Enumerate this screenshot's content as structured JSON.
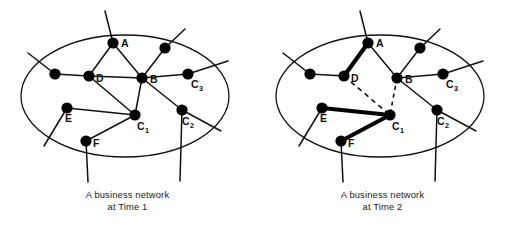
{
  "figure": {
    "colors": {
      "ink": "#111111",
      "node_fill": "#000000",
      "background": "#ffffff",
      "bold_edge": "#000000"
    }
  },
  "panels": [
    {
      "id": "time1",
      "caption_line1": "A business network",
      "caption_line2": "at Time 1",
      "boundary": {
        "shape": "ellipse",
        "cx": 125,
        "cy": 96,
        "rx": 104,
        "ry": 61
      },
      "nodes": [
        {
          "id": "A",
          "label": "A",
          "sub": "",
          "x": 113,
          "y": 43,
          "r": 5.6,
          "label_dx": 8,
          "label_dy": 4
        },
        {
          "id": "B",
          "label": "B",
          "sub": "",
          "x": 142,
          "y": 78,
          "r": 5.6,
          "label_dx": 8,
          "label_dy": 5
        },
        {
          "id": "D",
          "label": "D",
          "sub": "",
          "x": 89,
          "y": 76,
          "r": 5.6,
          "label_dx": 7,
          "label_dy": 6
        },
        {
          "id": "E",
          "label": "E",
          "sub": "",
          "x": 67,
          "y": 108,
          "r": 5.6,
          "label_dx": -2,
          "label_dy": 14
        },
        {
          "id": "F",
          "label": "F",
          "sub": "",
          "x": 86,
          "y": 141,
          "r": 5.6,
          "label_dx": 7,
          "label_dy": 6
        },
        {
          "id": "C1",
          "label": "C",
          "sub": "1",
          "x": 135,
          "y": 115,
          "r": 5.6,
          "label_dx": 2,
          "label_dy": 15
        },
        {
          "id": "C2",
          "label": "C",
          "sub": "2",
          "x": 182,
          "y": 110,
          "r": 5.6,
          "label_dx": 0,
          "label_dy": 15
        },
        {
          "id": "C3",
          "label": "C",
          "sub": "3",
          "x": 188,
          "y": 74,
          "r": 5.6,
          "label_dx": 3,
          "label_dy": 14
        },
        {
          "id": "U1",
          "label": "",
          "sub": "",
          "x": 55,
          "y": 74,
          "r": 5.6,
          "label_dx": 0,
          "label_dy": 0
        },
        {
          "id": "U2",
          "label": "",
          "sub": "",
          "x": 165,
          "y": 48,
          "r": 5.6,
          "label_dx": 0,
          "label_dy": 0
        }
      ],
      "edges": [
        {
          "from": "A",
          "to": "D",
          "style": "plain"
        },
        {
          "from": "A",
          "to": "B",
          "style": "plain"
        },
        {
          "from": "D",
          "to": "B",
          "style": "plain"
        },
        {
          "from": "D",
          "to": "U1",
          "style": "plain"
        },
        {
          "from": "D",
          "to": "C1",
          "style": "plain"
        },
        {
          "from": "B",
          "to": "C1",
          "style": "plain"
        },
        {
          "from": "B",
          "to": "C2",
          "style": "plain"
        },
        {
          "from": "B",
          "to": "C3",
          "style": "plain"
        },
        {
          "from": "B",
          "to": "U2",
          "style": "plain"
        },
        {
          "from": "E",
          "to": "C1",
          "style": "plain"
        },
        {
          "from": "F",
          "to": "C1",
          "style": "plain"
        }
      ],
      "stubs": [
        {
          "from": "A",
          "x2": 105,
          "y2": 11
        },
        {
          "from": "U1",
          "x2": 28,
          "y2": 53
        },
        {
          "from": "U2",
          "x2": 185,
          "y2": 29
        },
        {
          "from": "C3",
          "x2": 228,
          "y2": 61
        },
        {
          "from": "C2",
          "x2": 221,
          "y2": 131
        },
        {
          "from": "E",
          "x2": 44,
          "y2": 146
        },
        {
          "from": "F",
          "x2": 88,
          "y2": 182
        },
        {
          "from": "C2",
          "x2": 180,
          "y2": 181
        }
      ]
    },
    {
      "id": "time2",
      "caption_line1": "A business network",
      "caption_line2": "at Time 2",
      "boundary": {
        "shape": "ellipse",
        "cx": 125,
        "cy": 96,
        "rx": 104,
        "ry": 61
      },
      "nodes": [
        {
          "id": "A",
          "label": "A",
          "sub": "",
          "x": 113,
          "y": 43,
          "r": 5.6,
          "label_dx": 8,
          "label_dy": 4
        },
        {
          "id": "B",
          "label": "B",
          "sub": "",
          "x": 142,
          "y": 78,
          "r": 5.6,
          "label_dx": 8,
          "label_dy": 5
        },
        {
          "id": "D",
          "label": "D",
          "sub": "",
          "x": 89,
          "y": 76,
          "r": 5.6,
          "label_dx": 7,
          "label_dy": 6
        },
        {
          "id": "E",
          "label": "E",
          "sub": "",
          "x": 67,
          "y": 108,
          "r": 5.6,
          "label_dx": -2,
          "label_dy": 14
        },
        {
          "id": "F",
          "label": "F",
          "sub": "",
          "x": 86,
          "y": 141,
          "r": 5.6,
          "label_dx": 7,
          "label_dy": 6
        },
        {
          "id": "C1",
          "label": "C",
          "sub": "1",
          "x": 135,
          "y": 115,
          "r": 5.6,
          "label_dx": 2,
          "label_dy": 15
        },
        {
          "id": "C2",
          "label": "C",
          "sub": "2",
          "x": 182,
          "y": 110,
          "r": 5.6,
          "label_dx": 0,
          "label_dy": 15
        },
        {
          "id": "C3",
          "label": "C",
          "sub": "3",
          "x": 188,
          "y": 74,
          "r": 5.6,
          "label_dx": 3,
          "label_dy": 14
        },
        {
          "id": "U1",
          "label": "",
          "sub": "",
          "x": 55,
          "y": 74,
          "r": 5.6,
          "label_dx": 0,
          "label_dy": 0
        },
        {
          "id": "U2",
          "label": "",
          "sub": "",
          "x": 165,
          "y": 48,
          "r": 5.6,
          "label_dx": 0,
          "label_dy": 0
        }
      ],
      "edges": [
        {
          "from": "A",
          "to": "D",
          "style": "bold"
        },
        {
          "from": "A",
          "to": "B",
          "style": "plain"
        },
        {
          "from": "D",
          "to": "U1",
          "style": "plain"
        },
        {
          "from": "D",
          "to": "C1",
          "style": "dashed"
        },
        {
          "from": "B",
          "to": "C1",
          "style": "dashed-short"
        },
        {
          "from": "B",
          "to": "C2",
          "style": "plain"
        },
        {
          "from": "B",
          "to": "C3",
          "style": "plain"
        },
        {
          "from": "B",
          "to": "U2",
          "style": "plain"
        },
        {
          "from": "E",
          "to": "C1",
          "style": "bold"
        },
        {
          "from": "F",
          "to": "C1",
          "style": "bold"
        }
      ],
      "stubs": [
        {
          "from": "A",
          "x2": 105,
          "y2": 11
        },
        {
          "from": "U1",
          "x2": 28,
          "y2": 53
        },
        {
          "from": "U2",
          "x2": 185,
          "y2": 29
        },
        {
          "from": "C3",
          "x2": 228,
          "y2": 61
        },
        {
          "from": "C2",
          "x2": 221,
          "y2": 131
        },
        {
          "from": "E",
          "x2": 44,
          "y2": 146
        },
        {
          "from": "F",
          "x2": 88,
          "y2": 182
        },
        {
          "from": "C2",
          "x2": 180,
          "y2": 181
        }
      ]
    }
  ]
}
